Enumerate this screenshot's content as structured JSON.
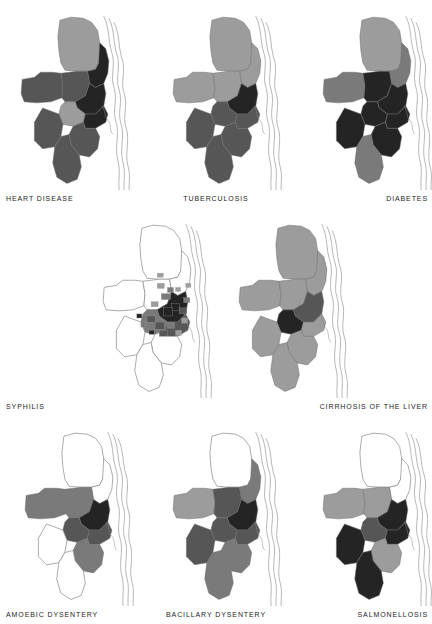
{
  "figure": {
    "title": "",
    "background_color": "#ffffff",
    "layout": "3-2-3 grid of choropleth maps",
    "map_count": 8
  },
  "palette": {
    "white": "#ffffff",
    "very_light": "#c9c9c9",
    "light": "#9c9c9c",
    "medium": "#7a7a7a",
    "medium_dark": "#565656",
    "dark": "#383838",
    "very_dark": "#242424",
    "outline": "#8a8a8a",
    "text": "#242424"
  },
  "maps": [
    {
      "id": "heart-disease",
      "label": "HEART DISEASE",
      "label_align": "left",
      "row": 1,
      "col": 1,
      "regions": [
        {
          "name": "north",
          "shade": "light"
        },
        {
          "name": "northeast-ridge",
          "shade": "very_dark"
        },
        {
          "name": "west-panhandle",
          "shade": "medium_dark"
        },
        {
          "name": "west-central",
          "shade": "medium_dark"
        },
        {
          "name": "central-core",
          "shade": "very_dark"
        },
        {
          "name": "central-south",
          "shade": "light"
        },
        {
          "name": "south-strip",
          "shade": "very_dark"
        },
        {
          "name": "southwest",
          "shade": "medium_dark"
        },
        {
          "name": "southeast",
          "shade": "medium_dark"
        },
        {
          "name": "far-south",
          "shade": "medium_dark"
        }
      ]
    },
    {
      "id": "tuberculosis",
      "label": "TUBERCULOSIS",
      "label_align": "center",
      "row": 1,
      "col": 2,
      "regions": [
        {
          "name": "north",
          "shade": "light"
        },
        {
          "name": "northeast-ridge",
          "shade": "light"
        },
        {
          "name": "west-panhandle",
          "shade": "light"
        },
        {
          "name": "west-central",
          "shade": "light"
        },
        {
          "name": "central-core",
          "shade": "very_dark"
        },
        {
          "name": "central-south",
          "shade": "medium_dark"
        },
        {
          "name": "south-strip",
          "shade": "medium_dark"
        },
        {
          "name": "southwest",
          "shade": "medium_dark"
        },
        {
          "name": "southeast",
          "shade": "medium_dark"
        },
        {
          "name": "far-south",
          "shade": "medium_dark"
        }
      ]
    },
    {
      "id": "diabetes",
      "label": "DIABETES",
      "label_align": "right",
      "row": 1,
      "col": 3,
      "regions": [
        {
          "name": "north",
          "shade": "light"
        },
        {
          "name": "northeast-ridge",
          "shade": "medium"
        },
        {
          "name": "west-panhandle",
          "shade": "medium"
        },
        {
          "name": "west-central",
          "shade": "very_dark"
        },
        {
          "name": "central-core",
          "shade": "very_dark"
        },
        {
          "name": "central-south",
          "shade": "very_dark"
        },
        {
          "name": "south-strip",
          "shade": "very_dark"
        },
        {
          "name": "southwest",
          "shade": "very_dark"
        },
        {
          "name": "southeast",
          "shade": "very_dark"
        },
        {
          "name": "far-south",
          "shade": "medium"
        }
      ]
    },
    {
      "id": "syphilis",
      "label": "SYPHILIS",
      "label_align": "left",
      "row": 2,
      "col": 1,
      "note": "fine census-tract subdivision; mostly unshaded with scattered dark tracts near the urban core",
      "regions": [
        {
          "name": "north",
          "shade": "white"
        },
        {
          "name": "northeast-ridge",
          "shade": "white"
        },
        {
          "name": "west-panhandle",
          "shade": "white"
        },
        {
          "name": "west-central",
          "shade": "white"
        },
        {
          "name": "central-core",
          "shade": "very_dark"
        },
        {
          "name": "central-south",
          "shade": "medium"
        },
        {
          "name": "south-strip",
          "shade": "medium_dark"
        },
        {
          "name": "southwest",
          "shade": "white"
        },
        {
          "name": "southeast",
          "shade": "white"
        },
        {
          "name": "far-south",
          "shade": "white"
        }
      ]
    },
    {
      "id": "cirrhosis-of-the-liver",
      "label": "CIRRHOSIS OF THE LIVER",
      "label_align": "right",
      "row": 2,
      "col": 3,
      "regions": [
        {
          "name": "north",
          "shade": "light"
        },
        {
          "name": "northeast-ridge",
          "shade": "light"
        },
        {
          "name": "west-panhandle",
          "shade": "light"
        },
        {
          "name": "west-central",
          "shade": "light"
        },
        {
          "name": "central-core",
          "shade": "medium_dark"
        },
        {
          "name": "central-south",
          "shade": "very_dark"
        },
        {
          "name": "south-strip",
          "shade": "light"
        },
        {
          "name": "southwest",
          "shade": "light"
        },
        {
          "name": "southeast",
          "shade": "light"
        },
        {
          "name": "far-south",
          "shade": "light"
        }
      ]
    },
    {
      "id": "amoebic-dysentery",
      "label": "AMOEBIC DYSENTERY",
      "label_align": "left",
      "row": 3,
      "col": 1,
      "regions": [
        {
          "name": "north",
          "shade": "white"
        },
        {
          "name": "northeast-ridge",
          "shade": "white"
        },
        {
          "name": "west-panhandle",
          "shade": "medium"
        },
        {
          "name": "west-central",
          "shade": "medium"
        },
        {
          "name": "central-core",
          "shade": "very_dark"
        },
        {
          "name": "central-south",
          "shade": "medium_dark"
        },
        {
          "name": "south-strip",
          "shade": "medium_dark"
        },
        {
          "name": "southwest",
          "shade": "white"
        },
        {
          "name": "southeast",
          "shade": "medium"
        },
        {
          "name": "far-south",
          "shade": "white"
        }
      ]
    },
    {
      "id": "bacillary-dysentery",
      "label": "BACILLARY DYSENTERY",
      "label_align": "center",
      "row": 3,
      "col": 2,
      "regions": [
        {
          "name": "north",
          "shade": "white"
        },
        {
          "name": "northeast-ridge",
          "shade": "medium"
        },
        {
          "name": "west-panhandle",
          "shade": "light"
        },
        {
          "name": "west-central",
          "shade": "medium_dark"
        },
        {
          "name": "central-core",
          "shade": "very_dark"
        },
        {
          "name": "central-south",
          "shade": "medium_dark"
        },
        {
          "name": "south-strip",
          "shade": "medium_dark"
        },
        {
          "name": "southwest",
          "shade": "medium_dark"
        },
        {
          "name": "southeast",
          "shade": "medium"
        },
        {
          "name": "far-south",
          "shade": "medium"
        }
      ]
    },
    {
      "id": "salmonellosis",
      "label": "SALMONELLOSIS",
      "label_align": "right",
      "row": 3,
      "col": 3,
      "regions": [
        {
          "name": "north",
          "shade": "white"
        },
        {
          "name": "northeast-ridge",
          "shade": "white"
        },
        {
          "name": "west-panhandle",
          "shade": "light"
        },
        {
          "name": "west-central",
          "shade": "light"
        },
        {
          "name": "central-core",
          "shade": "very_dark"
        },
        {
          "name": "central-south",
          "shade": "medium_dark"
        },
        {
          "name": "south-strip",
          "shade": "very_dark"
        },
        {
          "name": "southwest",
          "shade": "very_dark"
        },
        {
          "name": "southeast",
          "shade": "light"
        },
        {
          "name": "far-south",
          "shade": "very_dark"
        }
      ]
    }
  ]
}
